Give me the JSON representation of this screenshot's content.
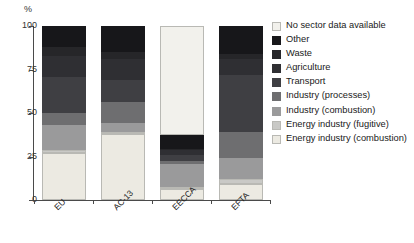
{
  "axis": {
    "unit_label": "%",
    "y_ticks": [
      "100",
      "75",
      "50",
      "25",
      "0"
    ]
  },
  "legend": {
    "items": [
      {
        "label": "No sector data available",
        "color": "#f2f1ec"
      },
      {
        "label": "Other",
        "color": "#17171a"
      },
      {
        "label": "Waste",
        "color": "#262629"
      },
      {
        "label": "Agriculture",
        "color": "#2f2f33"
      },
      {
        "label": "Transport",
        "color": "#3f3f43"
      },
      {
        "label": "Industry (processes)",
        "color": "#6e6e70"
      },
      {
        "label": "Industry (combustion)",
        "color": "#9a9a9b"
      },
      {
        "label": "Energy industry (fugitive)",
        "color": "#c9c9c6"
      },
      {
        "label": "Energy industry (combustion)",
        "color": "#eceae2"
      }
    ]
  },
  "chart_data": {
    "type": "bar",
    "subtype": "stacked-percentage",
    "title": "",
    "xlabel": "",
    "ylabel": "%",
    "ylim": [
      0,
      100
    ],
    "grid": false,
    "legend_position": "right",
    "categories": [
      "EU",
      "AC-13",
      "EECCA",
      "EFTA"
    ],
    "series": [
      {
        "name": "Energy industry (combustion)",
        "color": "#eceae2",
        "values": [
          27,
          38,
          6.5,
          9
        ]
      },
      {
        "name": "Energy industry (fugitive)",
        "color": "#c9c9c6",
        "values": [
          2,
          1,
          1,
          3
        ]
      },
      {
        "name": "Industry (combustion)",
        "color": "#9a9a9b",
        "values": [
          14,
          5,
          13,
          12
        ]
      },
      {
        "name": "Industry (processes)",
        "color": "#6e6e70",
        "values": [
          7,
          12,
          2,
          15
        ]
      },
      {
        "name": "Transport",
        "color": "#3f3f43",
        "values": [
          21,
          13,
          3,
          33
        ]
      },
      {
        "name": "Agriculture",
        "color": "#2f2f33",
        "values": [
          12,
          12,
          3,
          9
        ]
      },
      {
        "name": "Waste",
        "color": "#262629",
        "values": [
          5,
          4,
          1,
          3
        ]
      },
      {
        "name": "Other",
        "color": "#17171a",
        "values": [
          12,
          15,
          8,
          16
        ]
      },
      {
        "name": "No sector data available",
        "color": "#f2f1ec",
        "values": [
          0,
          0,
          62.5,
          0
        ]
      }
    ]
  }
}
